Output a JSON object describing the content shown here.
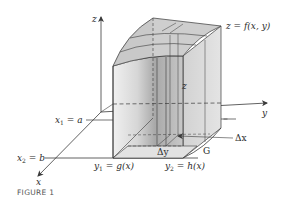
{
  "figure": {
    "caption": "FIGURE 1",
    "axes": {
      "z_label": "z",
      "y_label": "y",
      "x_label": "x"
    },
    "labels": {
      "surface": "z = f(x, y)",
      "height": "z",
      "x1_main": "x",
      "x1_sub": "1",
      "x1_rhs": " = a",
      "x2_main": "x",
      "x2_sub": "2",
      "x2_rhs": " = b",
      "y1_main": "y",
      "y1_sub": "1",
      "y1_rhs": " = g(x)",
      "y2_main": "y",
      "y2_sub": "2",
      "y2_rhs": " = h(x)",
      "delta_x": "Δx",
      "delta_y": "Δy",
      "region": "G"
    },
    "colors": {
      "line": "#3a3a3a",
      "face_light": "#e6e6e6",
      "face_mid": "#cfcfcf",
      "face_dark": "#9c9c9c",
      "top": "#d8d8d8"
    }
  }
}
